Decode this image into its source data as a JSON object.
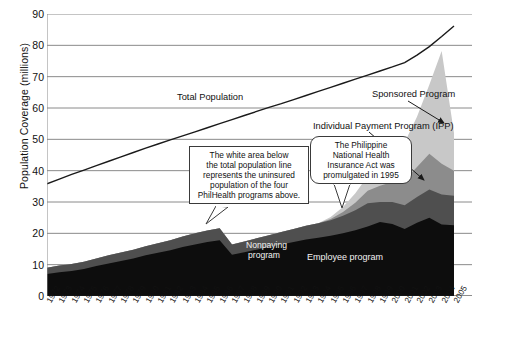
{
  "chart_data": {
    "type": "area",
    "title": "",
    "xlabel": "",
    "ylabel": "Population Coverage (millions)",
    "ylim": [
      0,
      90
    ],
    "yticks": [
      0,
      10,
      20,
      30,
      40,
      50,
      60,
      70,
      80,
      90
    ],
    "grid": true,
    "legend_position": "inline-annotations",
    "categories": [
      "1972",
      "1973",
      "1974",
      "1975",
      "1976",
      "1977",
      "1978",
      "1979",
      "1980",
      "1981",
      "1982",
      "1983",
      "1984",
      "1985",
      "1986",
      "1987",
      "1988",
      "1989",
      "1990",
      "1991",
      "1992",
      "1993",
      "1994",
      "1995",
      "1996",
      "1997",
      "1998",
      "1999",
      "2000",
      "2001",
      "2002",
      "2003",
      "2004",
      "2005"
    ],
    "series": [
      {
        "name": "Employee program",
        "color": "#0d0d0d",
        "values": [
          7.0,
          7.6,
          8.0,
          8.6,
          9.6,
          10.4,
          11.2,
          12.0,
          13.0,
          13.8,
          14.6,
          15.6,
          16.4,
          17.2,
          17.8,
          13.2,
          14.0,
          14.8,
          15.6,
          16.4,
          17.2,
          18.0,
          18.6,
          19.2,
          20.0,
          21.0,
          22.2,
          23.6,
          23.0,
          21.4,
          23.4,
          25.0,
          22.8,
          22.6
        ]
      },
      {
        "name": "Nonpaying program",
        "color": "#4f4f4f",
        "values": [
          2.0,
          2.1,
          2.2,
          2.3,
          2.4,
          2.6,
          2.7,
          2.8,
          2.9,
          3.0,
          3.2,
          3.4,
          3.6,
          3.7,
          3.8,
          3.2,
          3.4,
          3.6,
          3.8,
          4.0,
          4.2,
          4.4,
          4.6,
          5.0,
          5.6,
          6.4,
          7.4,
          6.4,
          7.0,
          7.6,
          8.2,
          9.0,
          9.6,
          9.4
        ]
      },
      {
        "name": "Individual Payment Program (IPP)",
        "color": "#8c8c8c",
        "values": [
          0,
          0,
          0,
          0,
          0,
          0,
          0,
          0,
          0,
          0,
          0,
          0,
          0,
          0,
          0,
          0,
          0,
          0,
          0,
          0,
          0,
          0,
          0,
          0.4,
          1.2,
          2.4,
          4.0,
          5.2,
          6.4,
          8.0,
          9.6,
          11.4,
          9.8,
          8.0
        ]
      },
      {
        "name": "Sponsored Program",
        "color": "#c8c8c8",
        "values": [
          0,
          0,
          0,
          0,
          0,
          0,
          0,
          0,
          0,
          0,
          0,
          0,
          0,
          0,
          0,
          0,
          0,
          0,
          0,
          0,
          0,
          0,
          0,
          0.6,
          1.6,
          3.0,
          4.6,
          6.0,
          8.0,
          12.0,
          16.0,
          22.0,
          36.0,
          12.0
        ]
      }
    ],
    "total_population_line": {
      "name": "Total Population",
      "color": "#1a1a1a",
      "values": [
        35.8,
        37.3,
        38.8,
        40.2,
        41.6,
        43.0,
        44.4,
        45.8,
        47.2,
        48.5,
        49.8,
        51.1,
        52.4,
        53.7,
        55.0,
        56.3,
        57.6,
        58.9,
        60.2,
        61.4,
        62.7,
        64.0,
        65.3,
        66.6,
        67.9,
        69.2,
        70.5,
        71.8,
        73.1,
        74.5,
        76.9,
        79.6,
        82.8,
        86.2
      ]
    }
  },
  "annotations": {
    "total_population": "Total Population",
    "sponsored_program": "Sponsored Program",
    "ipp": "Individual Payment Program (IPP)",
    "nonpaying_line1": "Nonpaying",
    "nonpaying_line2": "program",
    "employee": "Employee program"
  },
  "callouts": [
    {
      "name": "white-area-callout",
      "lines": [
        "The white area below",
        "the total population line",
        "represents the uninsured",
        "population of the four",
        "PhilHealth programs above."
      ]
    },
    {
      "name": "philhealth-act-callout",
      "lines": [
        "The Philippine",
        "National Health",
        "Insurance Act was",
        "promulgated in 1995"
      ]
    }
  ]
}
